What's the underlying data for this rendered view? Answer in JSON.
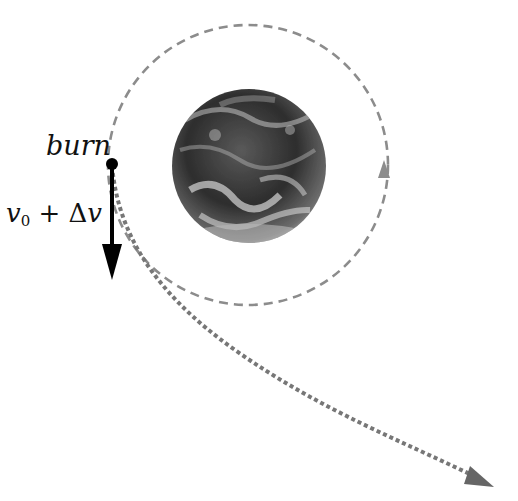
{
  "labels": {
    "burn": "burn",
    "velocity_var": "v",
    "velocity_sub": "0",
    "velocity_op": " + Δ",
    "velocity_var2": "v"
  },
  "colors": {
    "orbit": "#8c8c8c",
    "escape_path": "#777777",
    "arrow": "#000000",
    "background": "#ffffff"
  },
  "geometry": {
    "orbit_center": [
      248,
      165
    ],
    "orbit_radius": 140,
    "earth_center": [
      249,
      166
    ],
    "earth_radius": 77,
    "burn_point": [
      112,
      164
    ]
  }
}
